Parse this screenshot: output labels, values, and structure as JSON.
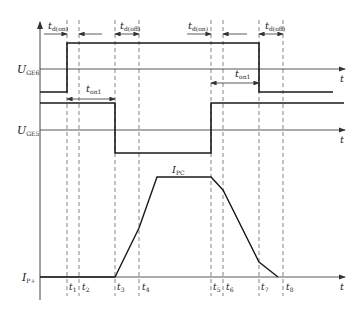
{
  "diagram": {
    "type": "timing-diagram",
    "axes": {
      "ge6": {
        "label_main": "U",
        "label_sub": "GE6",
        "time_label": "t"
      },
      "ge5": {
        "label_main": "U",
        "label_sub": "GE5",
        "time_label": "t"
      },
      "current": {
        "label_main": "I",
        "label_sub": "P+",
        "time_label": "t",
        "peak_label_main": "I",
        "peak_label_sub": "PC"
      }
    },
    "intervals": {
      "td_on_left": {
        "main": "t",
        "sub": "d(on)"
      },
      "td_off_left": {
        "main": "t",
        "sub": "d(off)"
      },
      "td_on_right": {
        "main": "t",
        "sub": "d(on)"
      },
      "td_off_right": {
        "main": "t",
        "sub": "d(off)"
      },
      "t_on1_left": {
        "main": "t",
        "sub": "on1"
      },
      "t_on1_right": {
        "main": "t",
        "sub": "on1"
      }
    },
    "time_marks": [
      {
        "main": "t",
        "sub": "1"
      },
      {
        "main": "t",
        "sub": "2"
      },
      {
        "main": "t",
        "sub": "3"
      },
      {
        "main": "t",
        "sub": "4"
      },
      {
        "main": "t",
        "sub": "5"
      },
      {
        "main": "t",
        "sub": "6"
      },
      {
        "main": "t",
        "sub": "7"
      },
      {
        "main": "t",
        "sub": "8"
      }
    ],
    "colors": {
      "signal": "#1a1a1a",
      "axis": "#444444",
      "dashed": "#555555"
    }
  }
}
